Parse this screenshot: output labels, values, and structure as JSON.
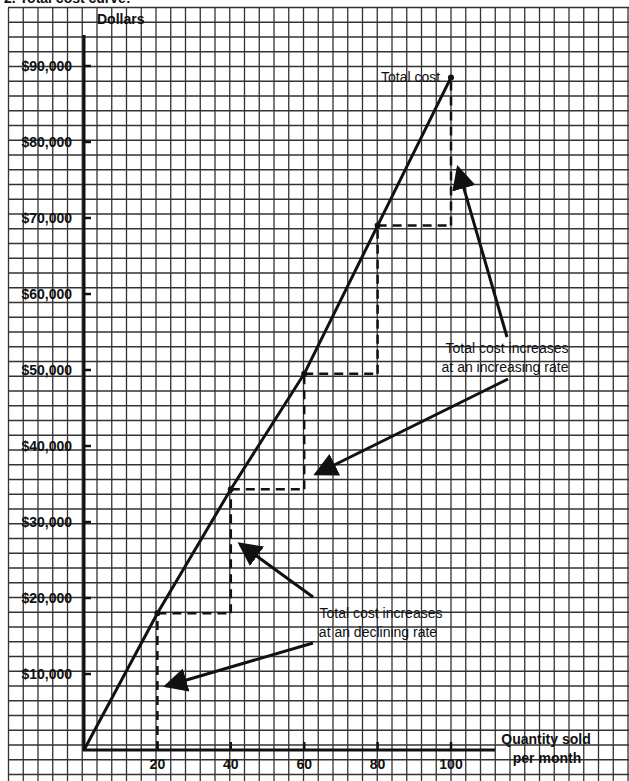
{
  "header": {
    "partial_title": "2.      Total cost curve:"
  },
  "chart_data": {
    "type": "line",
    "title": "Total cost curve",
    "ylabel": "Dollars",
    "xlabel": "Quantity sold per month",
    "xlabel_lines": [
      "Quantity sold",
      "per month"
    ],
    "x": [
      0,
      20,
      40,
      60,
      80,
      100
    ],
    "series": [
      {
        "name": "Total cost",
        "values": [
          0,
          18000,
          34300,
          49500,
          69000,
          88500
        ]
      }
    ],
    "x_ticks": [
      20,
      40,
      60,
      80,
      100
    ],
    "x_tick_labels": [
      "20",
      "40",
      "60",
      "80",
      "100"
    ],
    "y_ticks": [
      10000,
      20000,
      30000,
      40000,
      50000,
      60000,
      70000,
      80000,
      90000
    ],
    "y_tick_labels": [
      "$10,000",
      "$20,000",
      "$30,000",
      "$40,000",
      "$50,000",
      "$60,000",
      "$70,000",
      "$80,000",
      "$90,000"
    ],
    "xlim": [
      0,
      120
    ],
    "ylim": [
      0,
      95000
    ],
    "grid": true,
    "legend": "none",
    "series_label": "Total cost",
    "annotations": [
      {
        "lines": [
          "Total cost increases",
          "at an increasing rate"
        ],
        "points_to": [
          [
            100,
            76500
          ],
          [
            60,
            35500
          ]
        ]
      },
      {
        "lines": [
          "Total cost increases",
          "at an declining rate"
        ],
        "points_to": [
          [
            40,
            27500
          ],
          [
            20,
            8000
          ]
        ]
      }
    ],
    "step_guides": "dashed horizontal and vertical lines at each 20-unit step from one point to the next"
  },
  "colors": {
    "ink": "#111111",
    "grid": "#333333",
    "background": "#ffffff"
  }
}
